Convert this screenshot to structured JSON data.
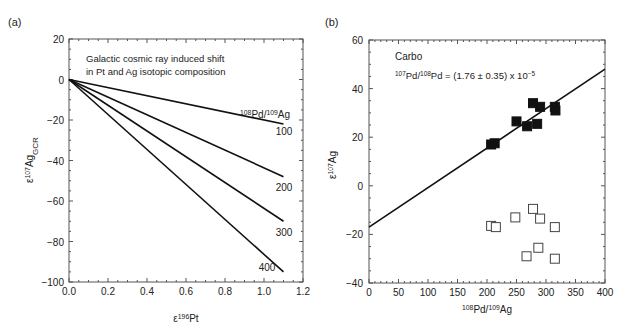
{
  "chart_data": [
    {
      "panel_label": "(a)",
      "type": "line",
      "title": "Galactic cosmic ray induced shift in Pt and Ag isotopic composition",
      "annotation_lines": [
        "Galactic cosmic ray induced shift",
        "in Pt and Ag isotopic composition"
      ],
      "legend_title": "108Pd/109Ag",
      "xlabel": "ε196Pt",
      "ylabel": "ε107Ag_GCR",
      "xlim": [
        0,
        1.2
      ],
      "ylim": [
        -100,
        20
      ],
      "xticks": [
        "0.0",
        "0.2",
        "0.4",
        "0.6",
        "0.8",
        "1.0",
        "1.2"
      ],
      "yticks": [
        "20",
        "0",
        "−20",
        "−40",
        "−60",
        "−80",
        "−100"
      ],
      "grid": false,
      "series": [
        {
          "name": "100",
          "x": [
            0,
            1.1
          ],
          "y": [
            0,
            -22
          ]
        },
        {
          "name": "200",
          "x": [
            0,
            1.1
          ],
          "y": [
            0,
            -48
          ]
        },
        {
          "name": "300",
          "x": [
            0,
            1.1
          ],
          "y": [
            0,
            -70
          ]
        },
        {
          "name": "400",
          "x": [
            0,
            1.1
          ],
          "y": [
            0,
            -95
          ]
        }
      ]
    },
    {
      "panel_label": "(b)",
      "type": "scatter",
      "title": "Carbo",
      "annotation": "107Pd/108Pd = (1.76 ± 0.35) x 10−5",
      "xlabel": "108Pd/109Ag",
      "ylabel": "ε107Ag",
      "xlim": [
        0,
        400
      ],
      "ylim": [
        -40,
        60
      ],
      "xticks": [
        "0",
        "50",
        "100",
        "150",
        "200",
        "250",
        "300",
        "350",
        "400"
      ],
      "yticks": [
        "60",
        "40",
        "20",
        "0",
        "−20",
        "−40"
      ],
      "grid": false,
      "fit_line": {
        "x": [
          0,
          400
        ],
        "y": [
          -17,
          48
        ]
      },
      "series": [
        {
          "name": "corrected (filled)",
          "marker": "filled-square",
          "x": [
            207,
            213,
            250,
            268,
            278,
            285,
            290,
            315,
            316
          ],
          "y": [
            17,
            17.5,
            26.5,
            24.5,
            34,
            25.5,
            32.5,
            32.5,
            31
          ]
        },
        {
          "name": "measured (open)",
          "marker": "open-square",
          "x": [
            207,
            215,
            248,
            267,
            278,
            287,
            290,
            315,
            315
          ],
          "y": [
            -16.5,
            -17,
            -13,
            -29,
            -9.5,
            -25.5,
            -13.5,
            -17,
            -30
          ]
        }
      ]
    }
  ]
}
